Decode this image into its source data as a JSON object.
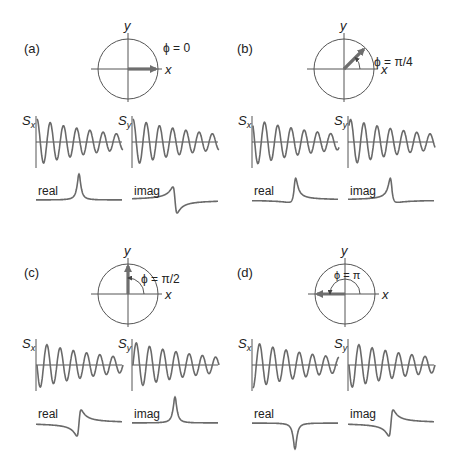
{
  "colors": {
    "ink": "#555555",
    "signal": "#6a6a6a",
    "arrow": "#6e6e6e",
    "text": "#222222"
  },
  "panels": [
    {
      "id": "a",
      "label": "(a)",
      "phase_label": "ϕ = 0",
      "phase_rad": 0,
      "cx": 128,
      "cy": 69,
      "ox": 0,
      "oy": 0,
      "axis_x": "x",
      "axis_y": "y",
      "sx_label": "S",
      "sx_sub": "x",
      "sy_label": "S",
      "sy_sub": "y",
      "real_label": "real",
      "imag_label": "imag",
      "real_shape": "absorption",
      "imag_shape": "dispersion-neg"
    },
    {
      "id": "b",
      "label": "(b)",
      "phase_label": "ϕ = π/4",
      "phase_rad": 0.7854,
      "cx": 344,
      "cy": 69,
      "ox": 216,
      "oy": 0,
      "axis_x": "x",
      "axis_y": "y",
      "sx_label": "S",
      "sx_sub": "x",
      "sy_label": "S",
      "sy_sub": "y",
      "real_label": "real",
      "imag_label": "imag",
      "real_shape": "mixed-a",
      "imag_shape": "mixed-b"
    },
    {
      "id": "c",
      "label": "(c)",
      "phase_label": "ϕ = π/2",
      "phase_rad": 1.5708,
      "cx": 128,
      "cy": 294,
      "ox": 0,
      "oy": 223,
      "axis_x": "x",
      "axis_y": "y",
      "sx_label": "S",
      "sx_sub": "x",
      "sy_label": "S",
      "sy_sub": "y",
      "real_label": "real",
      "imag_label": "imag",
      "real_shape": "dispersion-pos",
      "imag_shape": "absorption"
    },
    {
      "id": "d",
      "label": "(d)",
      "phase_label": "ϕ = π",
      "phase_rad": 3.1416,
      "cx": 345,
      "cy": 294,
      "ox": 216,
      "oy": 223,
      "axis_x": "x",
      "axis_y": "y",
      "sx_label": "S",
      "sx_sub": "x",
      "sy_label": "S",
      "sy_sub": "y",
      "real_label": "real",
      "imag_label": "imag",
      "real_shape": "neg-absorption",
      "imag_shape": "dispersion-pos"
    }
  ]
}
